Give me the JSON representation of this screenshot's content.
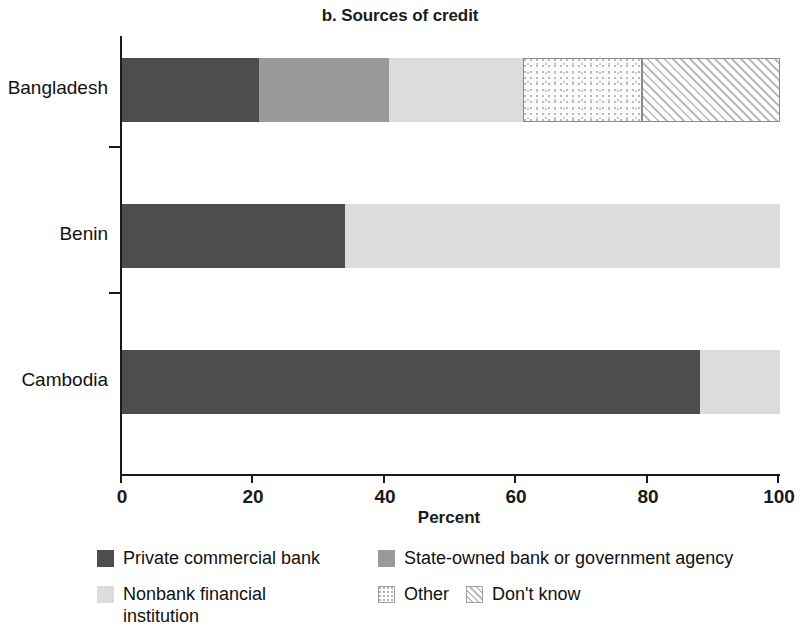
{
  "chart_data": {
    "type": "bar",
    "orientation": "horizontal",
    "stacked": true,
    "title": "b. Sources of credit",
    "xlabel": "Percent",
    "ylabel": "",
    "xlim": [
      0,
      100
    ],
    "xticks": [
      0,
      20,
      40,
      60,
      80,
      100
    ],
    "xtick_labels": [
      "0",
      "20",
      "40",
      "60",
      "80",
      "100"
    ],
    "grid": false,
    "legend_position": "bottom",
    "categories": [
      "Bangladesh",
      "Benin",
      "Cambodia"
    ],
    "series": [
      {
        "name": "Private commercial bank",
        "color": "#4d4d4d",
        "pattern": "solid",
        "values": [
          20.8,
          33.9,
          87.8
        ]
      },
      {
        "name": "State-owned bank or government agency",
        "color": "#9a9a9a",
        "pattern": "solid",
        "values": [
          19.8,
          0,
          0
        ]
      },
      {
        "name": "Nonbank financial institution",
        "color": "#dcdcdc",
        "pattern": "solid",
        "values": [
          20.4,
          66.1,
          12.2
        ]
      },
      {
        "name": "Other",
        "color": "#fbfbfb",
        "pattern": "stipple",
        "values": [
          18.0,
          0,
          0
        ]
      },
      {
        "name": "Don't know",
        "color": "#fdfdfd",
        "pattern": "diagonal-hatch",
        "values": [
          21.0,
          0,
          0
        ]
      }
    ]
  },
  "legend": {
    "items": [
      {
        "label": "Private commercial bank",
        "swatch": "private-commercial-bank-swatch"
      },
      {
        "label": "State-owned bank or government agency",
        "swatch": "state-owned-bank-swatch"
      },
      {
        "label": "Nonbank financial institution",
        "swatch": "nonbank-financial-institution-swatch"
      },
      {
        "label": "Other",
        "swatch": "other-swatch"
      },
      {
        "label": "Don't know",
        "swatch": "dont-know-swatch"
      }
    ]
  }
}
